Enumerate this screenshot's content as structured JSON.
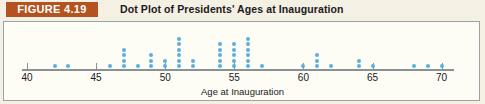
{
  "header": {
    "figure_badge": "FIGURE 4.19",
    "title": "Dot Plot of Presidents' Ages at Inauguration"
  },
  "colors": {
    "badge_background": "#b4531f",
    "badge_text": "#ffffff",
    "page_background": "#f4f0e4",
    "plot_background": "#fdfcf5",
    "plot_border": "#9aa3a8",
    "axis": "#8a9095",
    "dot": "#5aafe0"
  },
  "axis": {
    "title": "Age at Inauguration",
    "tick_labels": [
      "40",
      "45",
      "50",
      "55",
      "60",
      "65",
      "70"
    ],
    "tick_values": [
      40,
      45,
      50,
      55,
      60,
      65,
      70
    ],
    "range": [
      39,
      71
    ]
  },
  "chart_data": {
    "type": "scatter",
    "title": "Dot Plot of Presidents' Ages at Inauguration",
    "xlabel": "Age at Inauguration",
    "ylabel": "",
    "xlim": [
      39,
      71
    ],
    "grid": false,
    "legend": "none",
    "categories": [
      42,
      43,
      46,
      47,
      48,
      49,
      50,
      51,
      52,
      54,
      55,
      56,
      57,
      60,
      61,
      62,
      64,
      65,
      68,
      69,
      70
    ],
    "values": [
      1,
      1,
      1,
      4,
      1,
      3,
      2,
      6,
      2,
      5,
      5,
      6,
      1,
      1,
      3,
      1,
      2,
      1,
      1,
      1,
      1
    ],
    "counts_by_age": [
      {
        "age": 42,
        "count": 1
      },
      {
        "age": 43,
        "count": 1
      },
      {
        "age": 46,
        "count": 1
      },
      {
        "age": 47,
        "count": 4
      },
      {
        "age": 48,
        "count": 1
      },
      {
        "age": 49,
        "count": 3
      },
      {
        "age": 50,
        "count": 2
      },
      {
        "age": 51,
        "count": 6
      },
      {
        "age": 52,
        "count": 2
      },
      {
        "age": 54,
        "count": 5
      },
      {
        "age": 55,
        "count": 5
      },
      {
        "age": 56,
        "count": 6
      },
      {
        "age": 57,
        "count": 1
      },
      {
        "age": 60,
        "count": 1
      },
      {
        "age": 61,
        "count": 3
      },
      {
        "age": 62,
        "count": 1
      },
      {
        "age": 64,
        "count": 2
      },
      {
        "age": 65,
        "count": 1
      },
      {
        "age": 68,
        "count": 1
      },
      {
        "age": 69,
        "count": 1
      },
      {
        "age": 70,
        "count": 1
      }
    ]
  }
}
